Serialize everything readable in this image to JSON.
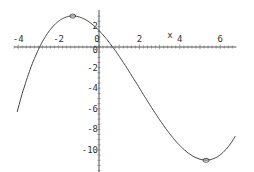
{
  "chart_data": {
    "type": "line",
    "title": "",
    "xlabel": "x",
    "ylabel": "",
    "xlim": [
      -4.2,
      6.8
    ],
    "ylim": [
      -12.2,
      3.6
    ],
    "x_ticks": [
      "-4",
      "-2",
      "0",
      "2",
      "4",
      "6"
    ],
    "y_ticks": [
      "2",
      "0",
      "-2",
      "-4",
      "-6",
      "-8",
      "-10"
    ],
    "grid": false,
    "series": [
      {
        "name": "f(x)",
        "function": "cubic",
        "x": [
          -4,
          -3,
          -2,
          -1.3,
          -1,
          0,
          1,
          2,
          3,
          4,
          5,
          5.3,
          6,
          6.8
        ],
        "y": [
          -10.4,
          -3.1,
          1.9,
          3.0,
          2.9,
          1.6,
          -0.9,
          -4.4,
          -7.8,
          -10.2,
          -10.9,
          -11.0,
          -10.3,
          -7.5
        ]
      }
    ],
    "markers": [
      {
        "label": "local-max",
        "x": -1.3,
        "y": 3.0
      },
      {
        "label": "local-min",
        "x": 5.3,
        "y": -11.0
      }
    ]
  },
  "axes": {
    "x_label": "x"
  }
}
